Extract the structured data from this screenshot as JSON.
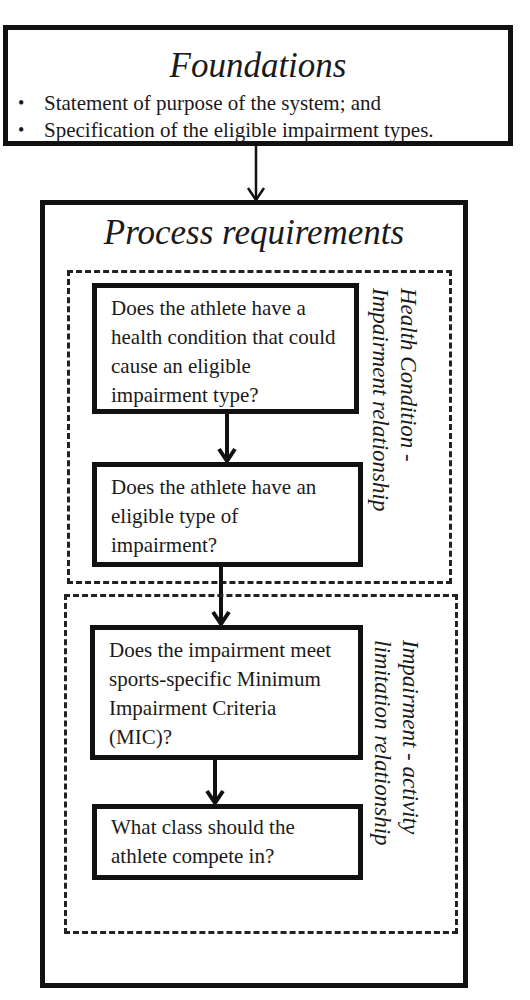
{
  "foundations": {
    "title": "Foundations",
    "bullets": [
      "Statement of  purpose of the system; and",
      "Specification of the eligible impairment types."
    ]
  },
  "process": {
    "title": "Process requirements",
    "groups": [
      {
        "label_line1": "Health Condition -",
        "label_line2": "Impairment relationship",
        "steps": [
          "Does the athlete have a health condition that could cause an eligible impairment type?",
          "Does the athlete have an eligible type of impairment?"
        ]
      },
      {
        "label_line1": "Impairment - activity",
        "label_line2": "limitation relationship",
        "steps": [
          "Does the impairment meet sports-specific Minimum Impairment Criteria (MIC)?",
          "What class should the athlete compete in?"
        ]
      }
    ]
  },
  "colors": {
    "line": "#111111",
    "background": "#ffffff",
    "text": "#1a1a1a"
  }
}
